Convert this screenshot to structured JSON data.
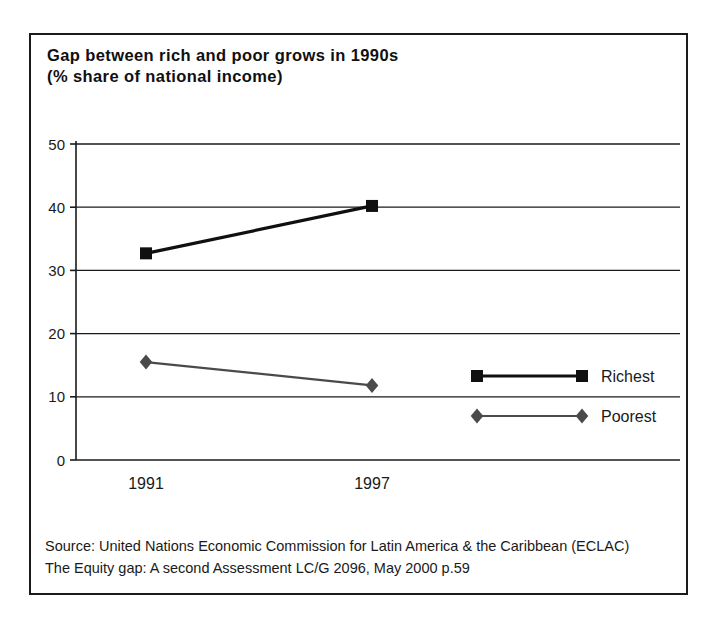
{
  "figure": {
    "title_line1": "Gap between rich and poor grows in 1990s",
    "title_line2": "(% share of national income)",
    "source_line1": "Source: United Nations Economic Commission for Latin America & the Caribbean (ECLAC)",
    "source_line2": "The Equity gap: A second Assessment LC/G 2096, May 2000 p.59",
    "frame_color": "#1a1a1a",
    "background_color": "#ffffff"
  },
  "chart_data": {
    "type": "line",
    "title": "Gap between rich and poor grows in 1990s (% share of national income)",
    "xlabel": "",
    "ylabel": "",
    "categories": [
      "1991",
      "1997"
    ],
    "x_tick_labels": [
      "1991",
      "1997"
    ],
    "y_tick_labels": [
      "0",
      "10",
      "20",
      "30",
      "40",
      "50"
    ],
    "y_ticks": [
      0,
      10,
      20,
      30,
      40,
      50
    ],
    "ylim": [
      0,
      50
    ],
    "grid": "horizontal",
    "legend_position": "inside-lower-right",
    "series": [
      {
        "name": "Richest",
        "values": [
          32.7,
          40.2
        ],
        "color": "#101010",
        "marker": "square",
        "line_width": 3.2
      },
      {
        "name": "Poorest",
        "values": [
          15.5,
          11.8
        ],
        "color": "#4a4a4a",
        "marker": "diamond",
        "line_width": 2.2
      }
    ],
    "legend": [
      {
        "label": "Richest",
        "marker": "square",
        "color": "#101010"
      },
      {
        "label": "Poorest",
        "marker": "diamond",
        "color": "#4a4a4a"
      }
    ]
  }
}
